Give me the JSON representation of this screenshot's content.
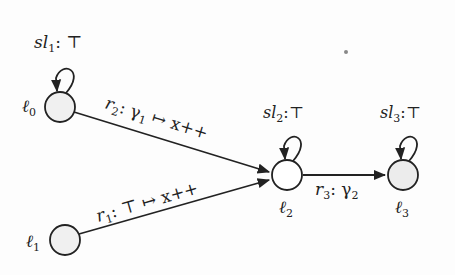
{
  "diagram": {
    "type": "state-transition-graph",
    "nodes": [
      {
        "id": "l0",
        "label": "ℓ0",
        "label_base": "ℓ",
        "label_sub": "0",
        "x": 60,
        "y": 107,
        "fill": "#f0f0f0",
        "self_loop": {
          "label_base": "sl",
          "label_sub": "1",
          "label_rest": ": ⊤"
        }
      },
      {
        "id": "l1",
        "label": "ℓ1",
        "label_base": "ℓ",
        "label_sub": "1",
        "x": 65,
        "y": 240,
        "fill": "#f0f0f0",
        "self_loop": null
      },
      {
        "id": "l2",
        "label": "ℓ2",
        "label_base": "ℓ",
        "label_sub": "2",
        "x": 287,
        "y": 175,
        "fill": "#ffffff",
        "self_loop": {
          "label_base": "sl",
          "label_sub": "2",
          "label_rest": ":⊤"
        }
      },
      {
        "id": "l3",
        "label": "ℓ3",
        "label_base": "ℓ",
        "label_sub": "3",
        "x": 403,
        "y": 175,
        "fill": "#ececec",
        "self_loop": {
          "label_base": "sl",
          "label_sub": "3",
          "label_rest": ":⊤"
        }
      }
    ],
    "edges": [
      {
        "from": "l0",
        "to": "l2",
        "name_base": "r",
        "name_sub": "2",
        "guard": ": γ",
        "guard_sub": "1",
        "update": " ↦ x++"
      },
      {
        "from": "l1",
        "to": "l2",
        "name_base": "r",
        "name_sub": "1",
        "guard": ": ⊤",
        "guard_sub": "",
        "update": " ↦ x++"
      },
      {
        "from": "l2",
        "to": "l3",
        "name_base": "r",
        "name_sub": "3",
        "guard": ": γ",
        "guard_sub": "2",
        "update": ""
      }
    ],
    "colors": {
      "stroke": "#222222",
      "node_fill_gray": "#f0f0f0",
      "node_fill_white": "#ffffff"
    }
  }
}
